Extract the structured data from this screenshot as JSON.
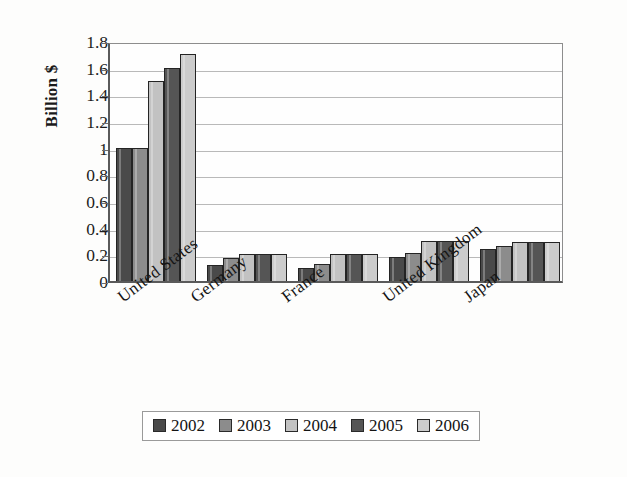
{
  "chart_data": {
    "type": "bar",
    "title": "",
    "xlabel": "",
    "ylabel": "Billion $",
    "ylim": [
      0,
      1.8
    ],
    "ytick_step": 0.2,
    "ytick_labels": [
      "1.8",
      "1.6",
      "1.4",
      "1.2",
      "1",
      "0.8",
      "0.6",
      "0.4",
      "0.2",
      "0"
    ],
    "grid": "horizontal",
    "legend_position": "bottom",
    "categories": [
      "United States",
      "Germany",
      "France",
      "United Kingdom",
      "Japan"
    ],
    "series": [
      {
        "name": "2002",
        "color": "#4a4a4a",
        "values": [
          1.0,
          0.12,
          0.1,
          0.18,
          0.24
        ]
      },
      {
        "name": "2003",
        "color": "#8c8c8c",
        "values": [
          1.0,
          0.17,
          0.13,
          0.21,
          0.26
        ]
      },
      {
        "name": "2004",
        "color": "#c2c2c2",
        "values": [
          1.5,
          0.2,
          0.2,
          0.3,
          0.29
        ]
      },
      {
        "name": "2005",
        "color": "#555555",
        "values": [
          1.6,
          0.2,
          0.2,
          0.3,
          0.29
        ]
      },
      {
        "name": "2006",
        "color": "#cccccc",
        "values": [
          1.7,
          0.2,
          0.2,
          0.3,
          0.29
        ]
      }
    ]
  }
}
